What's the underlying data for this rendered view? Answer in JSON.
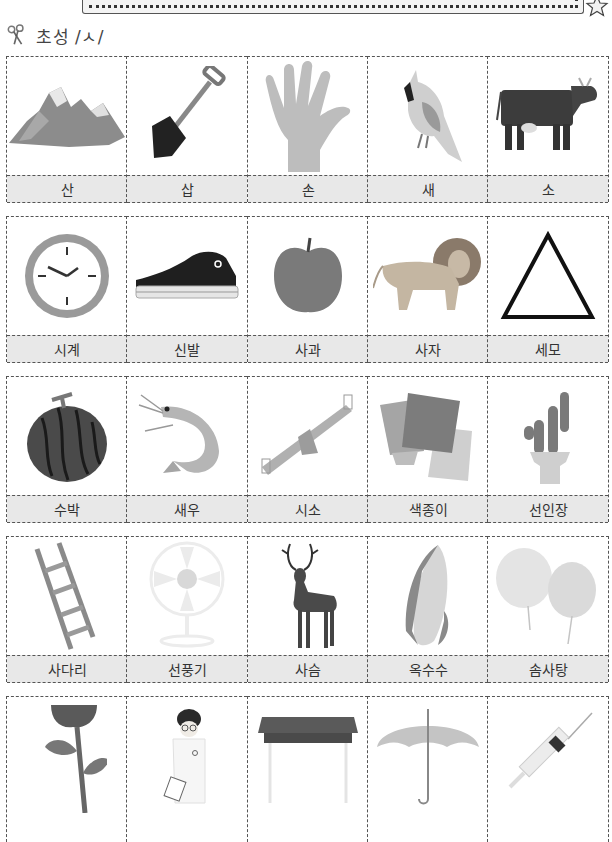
{
  "header": {
    "icon": "scissors-icon",
    "title": "초성 /ㅅ/"
  },
  "banner": {
    "decoration": "star-icon"
  },
  "rows": [
    {
      "cards": [
        {
          "label": "산",
          "image": "mountain"
        },
        {
          "label": "삽",
          "image": "shovel"
        },
        {
          "label": "손",
          "image": "hand"
        },
        {
          "label": "새",
          "image": "bird"
        },
        {
          "label": "소",
          "image": "cow"
        }
      ]
    },
    {
      "cards": [
        {
          "label": "시계",
          "image": "clock"
        },
        {
          "label": "신발",
          "image": "sneaker"
        },
        {
          "label": "사과",
          "image": "apple"
        },
        {
          "label": "사자",
          "image": "lion"
        },
        {
          "label": "세모",
          "image": "triangle"
        }
      ]
    },
    {
      "cards": [
        {
          "label": "수박",
          "image": "watermelon"
        },
        {
          "label": "새우",
          "image": "shrimp"
        },
        {
          "label": "시소",
          "image": "seesaw"
        },
        {
          "label": "색종이",
          "image": "colored-paper"
        },
        {
          "label": "선인장",
          "image": "cactus"
        }
      ]
    },
    {
      "cards": [
        {
          "label": "사다리",
          "image": "ladder"
        },
        {
          "label": "선풍기",
          "image": "electric-fan"
        },
        {
          "label": "사슴",
          "image": "deer"
        },
        {
          "label": "옥수수",
          "image": "corn"
        },
        {
          "label": "솜사탕",
          "image": "cotton-candy"
        }
      ]
    },
    {
      "cards": [
        {
          "label": "",
          "image": "flower-stem"
        },
        {
          "label": "",
          "image": "doctor"
        },
        {
          "label": "",
          "image": "desk"
        },
        {
          "label": "",
          "image": "umbrella"
        },
        {
          "label": "",
          "image": "syringe"
        }
      ]
    }
  ]
}
